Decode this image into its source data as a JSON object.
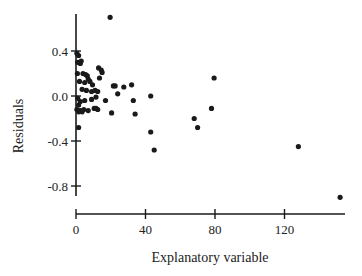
{
  "chart_data": {
    "type": "scatter",
    "title": "",
    "xlabel": "Explanatory variable",
    "ylabel": "Residuals",
    "xlim": [
      0,
      155
    ],
    "ylim": [
      -0.9,
      0.75
    ],
    "grid": false,
    "legend": null,
    "x_ticks": [
      0,
      40,
      80,
      120
    ],
    "x_tick_labels": [
      "0",
      "40",
      "80",
      "120"
    ],
    "y_ticks": [
      0.4,
      0.0,
      -0.4,
      -0.8
    ],
    "y_tick_labels": [
      "0.4",
      "0.0",
      "-0.4",
      "-0.8"
    ],
    "point_color": "#1a1a1a",
    "axis_color": "#1a1a1a",
    "points": [
      {
        "x": 19.6,
        "y": 0.7
      },
      {
        "x": 0.5,
        "y": 0.38
      },
      {
        "x": 1.5,
        "y": 0.36
      },
      {
        "x": 1.0,
        "y": 0.3
      },
      {
        "x": 2.5,
        "y": 0.29
      },
      {
        "x": 3.0,
        "y": 0.31
      },
      {
        "x": 0.8,
        "y": 0.2
      },
      {
        "x": 4.0,
        "y": 0.2
      },
      {
        "x": 5.5,
        "y": 0.19
      },
      {
        "x": 6.5,
        "y": 0.18
      },
      {
        "x": 7.0,
        "y": 0.15
      },
      {
        "x": 2.0,
        "y": 0.13
      },
      {
        "x": 5.0,
        "y": 0.12
      },
      {
        "x": 8.0,
        "y": 0.13
      },
      {
        "x": 9.5,
        "y": 0.1
      },
      {
        "x": 13.0,
        "y": 0.25
      },
      {
        "x": 14.5,
        "y": 0.23
      },
      {
        "x": 15.0,
        "y": 0.21
      },
      {
        "x": 13.5,
        "y": 0.16
      },
      {
        "x": 3.5,
        "y": 0.06
      },
      {
        "x": 6.0,
        "y": 0.05
      },
      {
        "x": 9.0,
        "y": 0.04
      },
      {
        "x": 11.0,
        "y": 0.05
      },
      {
        "x": 12.5,
        "y": 0.04
      },
      {
        "x": 21.5,
        "y": 0.09
      },
      {
        "x": 22.5,
        "y": 0.09
      },
      {
        "x": 27.5,
        "y": 0.08
      },
      {
        "x": 32.0,
        "y": 0.1
      },
      {
        "x": 24.0,
        "y": 0.02
      },
      {
        "x": 1.0,
        "y": -0.02
      },
      {
        "x": 2.5,
        "y": -0.05
      },
      {
        "x": 1.5,
        "y": -0.08
      },
      {
        "x": 5.0,
        "y": -0.04
      },
      {
        "x": 9.0,
        "y": -0.03
      },
      {
        "x": 11.5,
        "y": -0.01
      },
      {
        "x": 17.0,
        "y": -0.04
      },
      {
        "x": 0.5,
        "y": -0.12
      },
      {
        "x": 1.5,
        "y": -0.14
      },
      {
        "x": 2.5,
        "y": -0.13
      },
      {
        "x": 3.5,
        "y": -0.14
      },
      {
        "x": 4.5,
        "y": -0.12
      },
      {
        "x": 7.0,
        "y": -0.13
      },
      {
        "x": 10.5,
        "y": -0.11
      },
      {
        "x": 11.5,
        "y": -0.11
      },
      {
        "x": 12.5,
        "y": -0.12
      },
      {
        "x": 20.5,
        "y": -0.15
      },
      {
        "x": 33.0,
        "y": -0.04
      },
      {
        "x": 34.0,
        "y": -0.16
      },
      {
        "x": 43.0,
        "y": 0.0
      },
      {
        "x": 1.5,
        "y": -0.28
      },
      {
        "x": 43.0,
        "y": -0.32
      },
      {
        "x": 45.0,
        "y": -0.48
      },
      {
        "x": 68.0,
        "y": -0.2
      },
      {
        "x": 70.0,
        "y": -0.28
      },
      {
        "x": 78.0,
        "y": -0.11
      },
      {
        "x": 79.5,
        "y": 0.16
      },
      {
        "x": 128.0,
        "y": -0.45
      },
      {
        "x": 152.0,
        "y": -0.9
      }
    ]
  },
  "layout": {
    "x_axis_pixel": {
      "y": 214,
      "x0": 76,
      "px_per_unit": 1.7375,
      "x_end": 345
    },
    "y_axis_pixel": {
      "x": 76,
      "y0": 96,
      "px_per_unit": 112.5,
      "y_top": 14,
      "y_bottom": 196
    }
  }
}
